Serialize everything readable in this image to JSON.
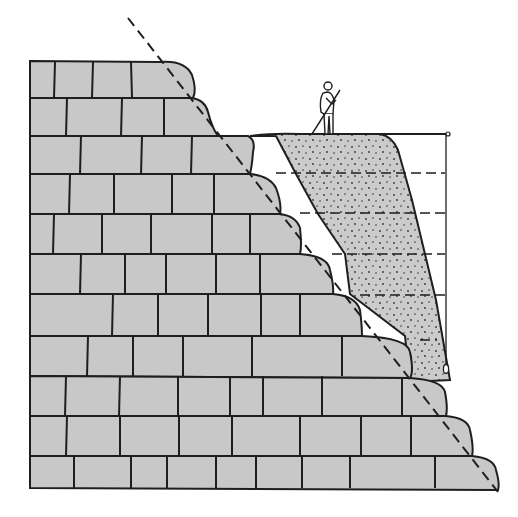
{
  "figure": {
    "title": "Stepped stone masonry wall with sloping fill and plumb-line survey",
    "colors": {
      "background": "#ffffff",
      "stone": "#c8c8c8",
      "fill": "#cbcbcb",
      "ink": "#1e1e1e"
    },
    "elements": [
      {
        "name": "masonry-wall",
        "description": "Eleven courses of rectangular stone blocks, stepping back toward the top on the right side"
      },
      {
        "name": "rubble-fill",
        "description": "Stippled earth/rubble fill banked against the stepped face of the wall"
      },
      {
        "name": "slope-line",
        "description": "Diagonal dashed line running from upper left down to lower right along the stepped face"
      },
      {
        "name": "surveyor-figure",
        "description": "Standing person on top of the fill holding a staff"
      },
      {
        "name": "horizontal-rod",
        "description": "Horizontal rod extending right from the top of the fill"
      },
      {
        "name": "plumb-line",
        "description": "Vertical line hanging from the rod end with a plumb bob at the bottom"
      },
      {
        "name": "offset-dashes",
        "description": "Five horizontal dashed measurement lines from the slope face to the plumb line"
      }
    ],
    "course_count": 11,
    "offset_line_count": 5
  }
}
